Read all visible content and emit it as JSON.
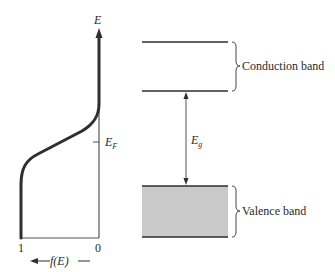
{
  "diagram": {
    "type": "energy-band diagram with Fermi-Dirac distribution",
    "left_plot": {
      "y_axis_label": "E",
      "fermi_level_label": "E",
      "fermi_level_subscript": "F",
      "x_tick_left": "1",
      "x_tick_right": "0",
      "x_axis_label": "f(E)"
    },
    "right_plot": {
      "conduction_band_label": "Conduction band",
      "valence_band_label": "Valence band",
      "gap_label": "E",
      "gap_subscript": "g"
    },
    "colors": {
      "line": "#2e2e2e",
      "valence_fill": "#c9c9c9",
      "background": "#ffffff"
    }
  }
}
